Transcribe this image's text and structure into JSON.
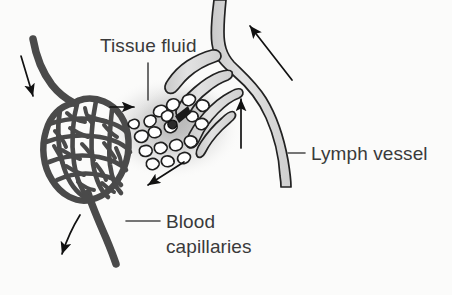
{
  "figure": {
    "background_color": "#fbfbfa",
    "text_color": "#3a3a3a"
  },
  "labels": {
    "tissue_fluid": "Tissue fluid",
    "lymph_vessel": "Lymph vessel",
    "blood_capillaries_line1": "Blood",
    "blood_capillaries_line2": "capillaries"
  },
  "colors": {
    "blood_capillary": "#4a4a4a",
    "blood_capillary_dark": "#3b3b3b",
    "lymph_fill": "#d8d8d8",
    "lymph_outline": "#222222",
    "cell_fill": "#ffffff",
    "cell_outline": "#1f1f1f",
    "tissue_fluid_haze": "#b9b9b9",
    "arrow": "#111111",
    "leader_line": "#4a4a4a"
  },
  "structures": [
    {
      "name": "blood-capillary-network",
      "description": "Dense oval mesh of anastomosing blood capillaries",
      "color": "#4a4a4a"
    },
    {
      "name": "arteriole-inflow",
      "description": "Vessel entering capillary bed from upper left",
      "color": "#4a4a4a"
    },
    {
      "name": "venule-outflow",
      "description": "Vessel leaving capillary bed toward lower left",
      "color": "#4a4a4a"
    },
    {
      "name": "lymph-capillaries",
      "description": "Blind-ended lymphatic capillary fingers draining tissue fluid",
      "color": "#d8d8d8"
    },
    {
      "name": "lymph-vessel-main",
      "description": "Main lymph vessel formed at Y junction, running to upper right",
      "color": "#d8d8d8"
    },
    {
      "name": "tissue-fluid-region",
      "description": "Hazy grey region of tissue fluid surrounding body cells",
      "color": "#b9b9b9"
    },
    {
      "name": "body-cells",
      "description": "Small white irregular body cells suspended in tissue fluid",
      "count": 19,
      "color": "#ffffff"
    }
  ],
  "flow_arrows": [
    {
      "name": "blood-inflow-arrow",
      "direction": "down-right",
      "meaning": "blood entering capillary bed"
    },
    {
      "name": "blood-outflow-arrow",
      "direction": "down-left",
      "meaning": "blood leaving capillary bed"
    },
    {
      "name": "fluid-out-arrow",
      "direction": "right",
      "meaning": "fluid leaks out of capillaries into tissue"
    },
    {
      "name": "fluid-return-arrow",
      "direction": "down-left",
      "meaning": "fluid reabsorbed into capillaries"
    },
    {
      "name": "lymph-uptake-arrow",
      "direction": "up",
      "meaning": "tissue fluid drains into lymph capillaries"
    },
    {
      "name": "lymph-flow-arrow",
      "direction": "up-left",
      "meaning": "lymph flows along lymph vessel"
    }
  ]
}
